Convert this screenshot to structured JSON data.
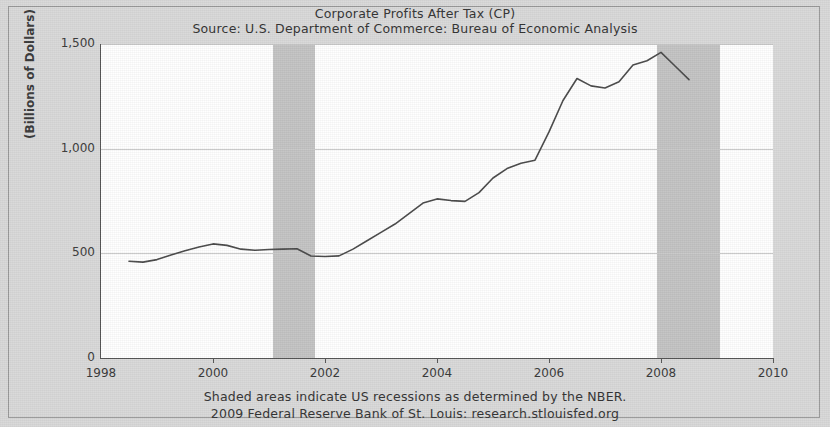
{
  "chart_data": {
    "type": "line",
    "title": "Corporate Profits After Tax (CP)",
    "subtitle": "Source: U.S. Department of Commerce: Bureau of Economic Analysis",
    "xlabel": "",
    "ylabel": "(Billions of Dollars)",
    "xlim": [
      1998,
      2010
    ],
    "ylim": [
      0,
      1500
    ],
    "ytick_labels": [
      "0",
      "500",
      "1,000",
      "1,500"
    ],
    "ytick_values": [
      0,
      500,
      1000,
      1500
    ],
    "xtick_labels": [
      "1998",
      "2000",
      "2002",
      "2004",
      "2006",
      "2008",
      "2010"
    ],
    "xtick_values": [
      1998,
      2000,
      2002,
      2004,
      2006,
      2008,
      2010
    ],
    "grid": true,
    "legend": null,
    "series": [
      {
        "name": "Corporate Profits After Tax (CP)",
        "color": "#4a4a4a",
        "x": [
          1998.5,
          1998.75,
          1999.0,
          1999.25,
          1999.5,
          1999.75,
          2000.0,
          2000.25,
          2000.5,
          2000.75,
          2001.0,
          2001.25,
          2001.5,
          2001.75,
          2002.0,
          2002.25,
          2002.5,
          2002.75,
          2003.0,
          2003.25,
          2003.5,
          2003.75,
          2004.0,
          2004.25,
          2004.5,
          2004.75,
          2005.0,
          2005.25,
          2005.5,
          2005.75,
          2006.0,
          2006.25,
          2006.5,
          2006.75,
          2007.0,
          2007.25,
          2007.5,
          2007.75,
          2008.0,
          2008.25,
          2008.5
        ],
        "values": [
          462,
          458,
          470,
          492,
          512,
          530,
          545,
          538,
          520,
          515,
          518,
          520,
          522,
          487,
          485,
          488,
          520,
          560,
          600,
          640,
          690,
          740,
          760,
          752,
          748,
          790,
          860,
          905,
          930,
          945,
          1080,
          1230,
          1335,
          1300,
          1290,
          1320,
          1400,
          1420,
          1460,
          1395,
          1330
        ]
      }
    ],
    "shaded_regions": [
      {
        "label": "US recession",
        "start": 2001.08,
        "end": 2001.83,
        "color": "#c4c4c4"
      },
      {
        "label": "US recession",
        "start": 2007.92,
        "end": 2009.05,
        "color": "#c4c4c4"
      }
    ],
    "notes": [
      "Shaded areas indicate US recessions as determined by the NBER.",
      "2009 Federal Reserve Bank of St. Louis: research.stlouisfed.org"
    ]
  }
}
